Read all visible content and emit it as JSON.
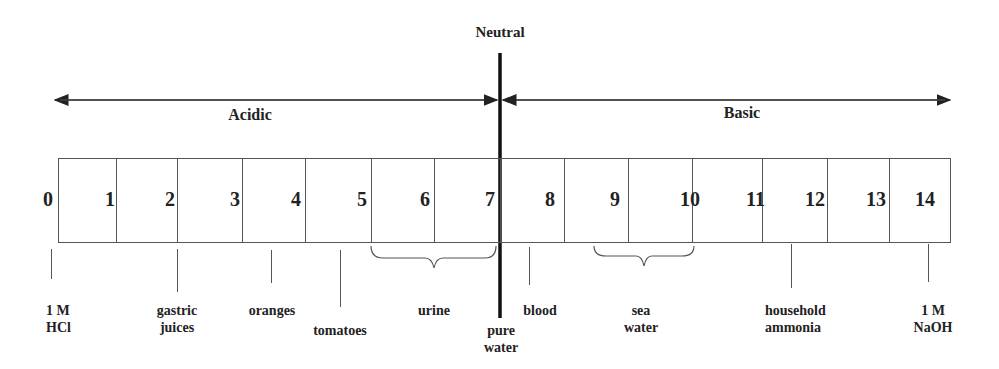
{
  "neutral_label": "Neutral",
  "acidic_label": "Acidic",
  "basic_label": "Basic",
  "scale_numbers": [
    "0",
    "1",
    "2",
    "3",
    "4",
    "5",
    "6",
    "7",
    "8",
    "9",
    "10",
    "11",
    "12",
    "13",
    "14"
  ],
  "substances": [
    {
      "line1": "1 M",
      "line2": "HCl",
      "ph": "0"
    },
    {
      "line1": "gastric",
      "line2": "juices",
      "ph": "2"
    },
    {
      "line1": "oranges",
      "line2": "",
      "ph": "4"
    },
    {
      "line1": "tomatoes",
      "line2": "",
      "ph": "5"
    },
    {
      "line1": "urine",
      "line2": "",
      "ph": "5-7"
    },
    {
      "line1": "pure",
      "line2": "water",
      "ph": "7"
    },
    {
      "line1": "blood",
      "line2": "",
      "ph": "8"
    },
    {
      "line1": "sea",
      "line2": "water",
      "ph": "9-10"
    },
    {
      "line1": "household",
      "line2": "ammonia",
      "ph": "12"
    },
    {
      "line1": "1 M",
      "line2": "NaOH",
      "ph": "14"
    }
  ],
  "colors": {
    "line": "#555555",
    "text": "#222222",
    "neutral_line": "#111111"
  }
}
